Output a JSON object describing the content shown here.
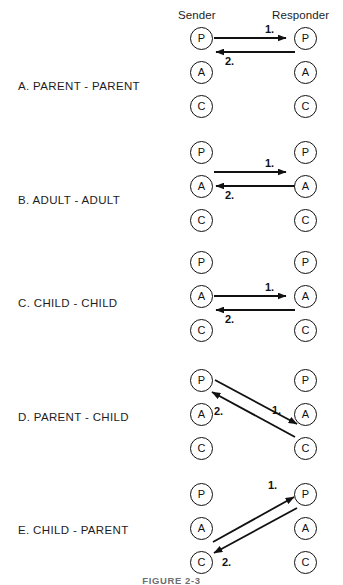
{
  "figure": {
    "caption": "FIGURE 2-3",
    "columns": {
      "sender": "Sender",
      "responder": "Responder"
    },
    "ego_states": {
      "parent": "P",
      "adult": "A",
      "child": "C"
    },
    "step_labels": {
      "first": "1.",
      "second": "2."
    },
    "colors": {
      "ink": "#111111",
      "background": "#ffffff",
      "caption": "#6e6e6e"
    }
  },
  "rows": [
    {
      "label": "A. PARENT - PARENT",
      "sender_nodes": [
        "P",
        "A",
        "C"
      ],
      "responder_nodes": [
        "P",
        "A",
        "C"
      ],
      "transactions": [
        {
          "number": "1.",
          "from": "sender.P",
          "to": "responder.P"
        },
        {
          "number": "2.",
          "from": "responder.P",
          "to": "sender.P"
        }
      ]
    },
    {
      "label": "B. ADULT - ADULT",
      "sender_nodes": [
        "P",
        "A",
        "C"
      ],
      "responder_nodes": [
        "P",
        "A",
        "C"
      ],
      "transactions": [
        {
          "number": "1.",
          "from": "sender.A",
          "to": "responder.A"
        },
        {
          "number": "2.",
          "from": "responder.A",
          "to": "sender.A"
        }
      ]
    },
    {
      "label": "C. CHILD - CHILD",
      "sender_nodes": [
        "P",
        "A",
        "C"
      ],
      "responder_nodes": [
        "P",
        "A",
        "C"
      ],
      "transactions": [
        {
          "number": "1.",
          "from": "sender.C",
          "to": "responder.C"
        },
        {
          "number": "2.",
          "from": "responder.C",
          "to": "sender.C"
        }
      ]
    },
    {
      "label": "D. PARENT - CHILD",
      "sender_nodes": [
        "P",
        "A",
        "C"
      ],
      "responder_nodes": [
        "P",
        "A",
        "C"
      ],
      "transactions": [
        {
          "number": "1.",
          "from": "sender.P",
          "to": "responder.C"
        },
        {
          "number": "2.",
          "from": "responder.C",
          "to": "sender.P"
        }
      ]
    },
    {
      "label": "E. CHILD - PARENT",
      "sender_nodes": [
        "P",
        "A",
        "C"
      ],
      "responder_nodes": [
        "P",
        "A",
        "C"
      ],
      "transactions": [
        {
          "number": "1.",
          "from": "sender.C",
          "to": "responder.P"
        },
        {
          "number": "2.",
          "from": "responder.P",
          "to": "sender.C"
        }
      ]
    }
  ]
}
